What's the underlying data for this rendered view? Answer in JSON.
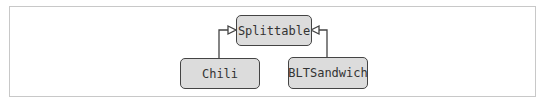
{
  "diagram": {
    "type": "uml-class-inheritance",
    "nodes": [
      {
        "id": "splittable",
        "label": "Splittable"
      },
      {
        "id": "chili",
        "label": "Chili"
      },
      {
        "id": "bltsandwich",
        "label": "BLTSandwich"
      }
    ],
    "edges": [
      {
        "from": "chili",
        "to": "splittable",
        "arrow": "hollow-triangle"
      },
      {
        "from": "bltsandwich",
        "to": "splittable",
        "arrow": "hollow-triangle"
      }
    ],
    "colors": {
      "node_fill": "#dcdcdc",
      "stroke": "#444444",
      "frame": "#c8c8c8"
    }
  }
}
